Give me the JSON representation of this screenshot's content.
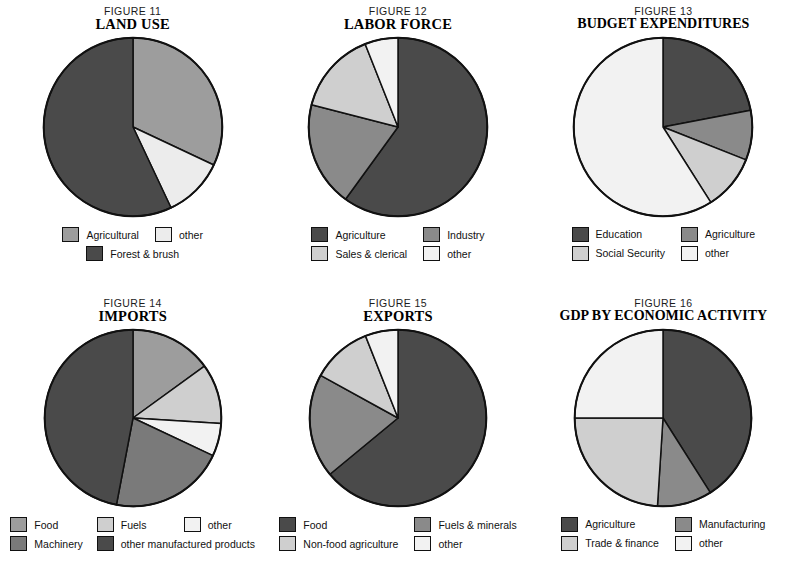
{
  "page": {
    "background": "#ffffff",
    "palette": {
      "darkest": "#3a3a3a",
      "dark": "#4a4a4a",
      "medium": "#787878",
      "medium_light": "#9d9d9d",
      "light": "#c9c9c9",
      "lighter": "#dcdcdc",
      "lightest": "#f2f2f2",
      "outline": "#111111"
    }
  },
  "chart_data": [
    {
      "type": "pie",
      "figure_number": "FIGURE 11",
      "title": "LAND USE",
      "start_angle": 0,
      "labels": [
        "Agricultural",
        "other",
        "Forest & brush"
      ],
      "values": [
        32,
        11,
        57
      ],
      "colors": [
        "#9d9d9d",
        "#ececec",
        "#4a4a4a"
      ],
      "legend": [
        {
          "label": "Agricultural",
          "color": "#9d9d9d"
        },
        {
          "label": "other",
          "color": "#ececec"
        },
        {
          "label": "Forest & brush",
          "color": "#4a4a4a"
        }
      ],
      "legend_position": "bottom"
    },
    {
      "type": "pie",
      "figure_number": "FIGURE 12",
      "title": "LABOR FORCE",
      "start_angle": 0,
      "labels": [
        "Agriculture",
        "Industry",
        "Sales & clerical",
        "other"
      ],
      "values": [
        60,
        19,
        15,
        6
      ],
      "colors": [
        "#4a4a4a",
        "#8a8a8a",
        "#cfcfcf",
        "#f2f2f2"
      ],
      "legend": [
        {
          "label": "Agriculture",
          "color": "#4a4a4a"
        },
        {
          "label": "Industry",
          "color": "#8a8a8a"
        },
        {
          "label": "Sales & clerical",
          "color": "#cfcfcf"
        },
        {
          "label": "other",
          "color": "#f2f2f2"
        }
      ],
      "legend_position": "bottom"
    },
    {
      "type": "pie",
      "figure_number": "FIGURE 13",
      "title": "BUDGET EXPENDITURES",
      "start_angle": 0,
      "labels": [
        "Education",
        "Agriculture",
        "Social Security",
        "other"
      ],
      "values": [
        22,
        9,
        10,
        59
      ],
      "colors": [
        "#4a4a4a",
        "#8a8a8a",
        "#cfcfcf",
        "#f2f2f2"
      ],
      "legend": [
        {
          "label": "Education",
          "color": "#4a4a4a"
        },
        {
          "label": "Agriculture",
          "color": "#8a8a8a"
        },
        {
          "label": "Social Security",
          "color": "#cfcfcf"
        },
        {
          "label": "other",
          "color": "#f2f2f2"
        }
      ],
      "legend_position": "bottom"
    },
    {
      "type": "pie",
      "figure_number": "FIGURE 14",
      "title": "IMPORTS",
      "start_angle": 0,
      "labels": [
        "Food",
        "Fuels",
        "other",
        "Machinery",
        "other manufactured products"
      ],
      "values": [
        15,
        11,
        6,
        21,
        47
      ],
      "colors": [
        "#9d9d9d",
        "#cfcfcf",
        "#f2f2f2",
        "#7a7a7a",
        "#4a4a4a"
      ],
      "legend": [
        {
          "label": "Food",
          "color": "#9d9d9d"
        },
        {
          "label": "Fuels",
          "color": "#cfcfcf"
        },
        {
          "label": "other",
          "color": "#f2f2f2"
        },
        {
          "label": "Machinery",
          "color": "#7a7a7a"
        },
        {
          "label": "other manufactured products",
          "color": "#4a4a4a"
        }
      ],
      "legend_position": "bottom"
    },
    {
      "type": "pie",
      "figure_number": "FIGURE 15",
      "title": "EXPORTS",
      "start_angle": 0,
      "labels": [
        "Food",
        "Fuels & minerals",
        "Non-food agriculture",
        "other"
      ],
      "values": [
        64,
        19,
        11,
        6
      ],
      "colors": [
        "#4a4a4a",
        "#8a8a8a",
        "#cfcfcf",
        "#f2f2f2"
      ],
      "legend": [
        {
          "label": "Food",
          "color": "#4a4a4a"
        },
        {
          "label": "Fuels & minerals",
          "color": "#8a8a8a"
        },
        {
          "label": "Non-food agriculture",
          "color": "#cfcfcf"
        },
        {
          "label": "other",
          "color": "#f2f2f2"
        }
      ],
      "legend_position": "bottom"
    },
    {
      "type": "pie",
      "figure_number": "FIGURE 16",
      "title": "GDP BY ECONOMIC ACTIVITY",
      "start_angle": 0,
      "labels": [
        "Agriculture",
        "Manufacturing",
        "Trade & finance",
        "other"
      ],
      "values": [
        41,
        10,
        24,
        25
      ],
      "colors": [
        "#4a4a4a",
        "#8a8a8a",
        "#cfcfcf",
        "#f2f2f2"
      ],
      "legend": [
        {
          "label": "Agriculture",
          "color": "#4a4a4a"
        },
        {
          "label": "Manufacturing",
          "color": "#8a8a8a"
        },
        {
          "label": "Trade & finance",
          "color": "#cfcfcf"
        },
        {
          "label": "other",
          "color": "#f2f2f2"
        }
      ],
      "legend_position": "bottom"
    }
  ]
}
